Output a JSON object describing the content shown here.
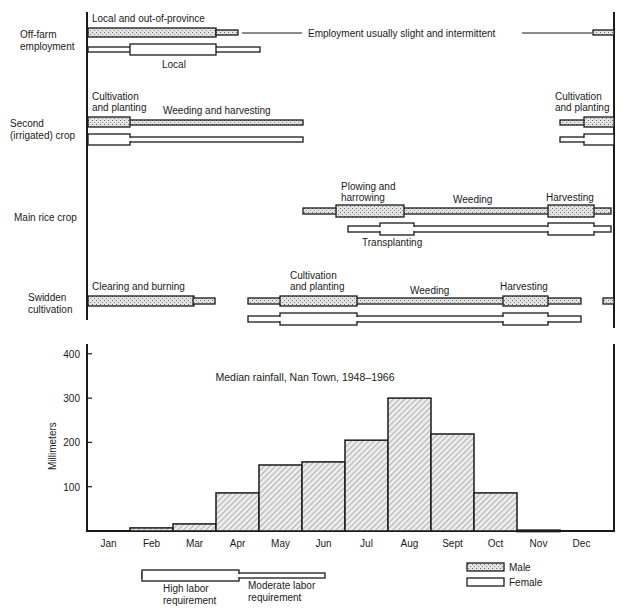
{
  "colors": {
    "ink": "#1a1a1a",
    "male_fill": "#d6d6d6",
    "female_fill": "#ffffff",
    "bar_fill": "#e2e2e2",
    "hatch": "#8a8a8a"
  },
  "activities": {
    "offfarm": {
      "row_label": [
        "Off-farm",
        "employment"
      ],
      "labels": {
        "male_top": "Local and out-of-province",
        "female_bottom": "Local",
        "note": "Employment usually slight and intermittent"
      }
    },
    "second": {
      "row_label": [
        "Second",
        "(irrigated) crop"
      ],
      "labels": {
        "cult_a": "Cultivation",
        "cult_b": "and planting",
        "weed": "Weeding and harvesting",
        "cult2_a": "Cultivation",
        "cult2_b": "and planting"
      }
    },
    "mainrice": {
      "row_label": [
        "Main rice crop"
      ],
      "labels": {
        "plow_a": "Plowing and",
        "plow_b": "harrowing",
        "weed": "Weeding",
        "harvest": "Harvesting",
        "transplant": "Transplanting"
      }
    },
    "swidden": {
      "row_label": [
        "Swidden",
        "cultivation"
      ],
      "labels": {
        "clear": "Clearing and burning",
        "cult_a": "Cultivation",
        "cult_b": "and planting",
        "weed": "Weeding",
        "harvest": "Harvesting"
      }
    }
  },
  "legend": {
    "high": [
      "High labor",
      "requirement"
    ],
    "moderate": [
      "Moderate labor",
      "requirement"
    ],
    "male": "Male",
    "female": "Female"
  },
  "chart_data": [
    {
      "type": "bar",
      "title": "Median rainfall, Nan Town, 1948–1966",
      "categories": [
        "Jan",
        "Feb",
        "Mar",
        "Apr",
        "May",
        "Jun",
        "Jul",
        "Aug",
        "Sept",
        "Oct",
        "Nov",
        "Dec"
      ],
      "values": [
        0,
        7,
        16,
        86,
        149,
        156,
        205,
        300,
        219,
        86,
        2,
        0
      ],
      "xlabel": "",
      "ylabel": "Millimeters",
      "yticks": [
        100,
        200,
        300,
        400
      ],
      "ylim": [
        0,
        420
      ],
      "grid": false,
      "bar_style": "hatched, no gaps"
    },
    {
      "type": "gantt",
      "title": "Seasonal labor calendar by activity and sex",
      "x_axis": "months Jan–Dec (shared with rainfall chart)",
      "legend": [
        "Male (stippled)",
        "Female (open)",
        "High labor requirement (wide bar)",
        "Moderate labor requirement (narrow bar)"
      ],
      "rows": [
        {
          "activity": "Off-farm employment",
          "sex": "Male",
          "segments": [
            {
              "from": "Jan",
              "to": "mid-Apr",
              "level": "high",
              "label": "Local and out-of-province"
            },
            {
              "from": "mid-Apr",
              "to": "early-May",
              "level": "moderate"
            },
            {
              "from": "early-May",
              "to": "late-Dec",
              "level": "slight",
              "label": "Employment usually slight and intermittent"
            },
            {
              "from": "late-Dec",
              "to": "Dec",
              "level": "moderate"
            }
          ]
        },
        {
          "activity": "Off-farm employment",
          "sex": "Female",
          "segments": [
            {
              "from": "Jan",
              "to": "early-Feb",
              "level": "moderate"
            },
            {
              "from": "early-Feb",
              "to": "mid-Apr",
              "level": "high",
              "label": "Local"
            },
            {
              "from": "mid-Apr",
              "to": "early-May",
              "level": "moderate"
            }
          ]
        },
        {
          "activity": "Second (irrigated) crop",
          "sex": "Male",
          "segments": [
            {
              "from": "Jan",
              "to": "Feb",
              "level": "high",
              "label": "Cultivation and planting"
            },
            {
              "from": "Feb",
              "to": "Jun",
              "level": "moderate",
              "label": "Weeding and harvesting"
            },
            {
              "from": "early-Dec",
              "to": "mid-Dec",
              "level": "moderate"
            },
            {
              "from": "mid-Dec",
              "to": "Dec",
              "level": "high",
              "label": "Cultivation and planting"
            }
          ]
        },
        {
          "activity": "Second (irrigated) crop",
          "sex": "Female",
          "segments": [
            {
              "from": "Jan",
              "to": "Feb",
              "level": "high"
            },
            {
              "from": "Feb",
              "to": "Jun",
              "level": "moderate"
            },
            {
              "from": "early-Dec",
              "to": "mid-Dec",
              "level": "moderate"
            },
            {
              "from": "mid-Dec",
              "to": "Dec",
              "level": "high"
            }
          ]
        },
        {
          "activity": "Main rice crop",
          "sex": "Male",
          "segments": [
            {
              "from": "Jun",
              "to": "late-Jun",
              "level": "moderate"
            },
            {
              "from": "late-Jun",
              "to": "late-Jul",
              "level": "high",
              "label": "Plowing and harrowing"
            },
            {
              "from": "late-Jul",
              "to": "mid-Nov",
              "level": "moderate",
              "label": "Weeding"
            },
            {
              "from": "mid-Nov",
              "to": "early-Dec",
              "level": "high",
              "label": "Harvesting"
            },
            {
              "from": "early-Dec",
              "to": "Dec",
              "level": "moderate"
            }
          ]
        },
        {
          "activity": "Main rice crop",
          "sex": "Female",
          "segments": [
            {
              "from": "early-Jul",
              "to": "mid-Jul",
              "level": "moderate"
            },
            {
              "from": "mid-Jul",
              "to": "late-Jul",
              "level": "high",
              "label": "Transplanting"
            },
            {
              "from": "late-Jul",
              "to": "mid-Nov",
              "level": "moderate"
            },
            {
              "from": "mid-Nov",
              "to": "early-Dec",
              "level": "high"
            },
            {
              "from": "early-Dec",
              "to": "Dec",
              "level": "moderate"
            }
          ]
        },
        {
          "activity": "Swidden cultivation",
          "sex": "Male",
          "segments": [
            {
              "from": "Jan",
              "to": "mid-Mar",
              "level": "high",
              "label": "Clearing and burning"
            },
            {
              "from": "mid-Mar",
              "to": "late-Mar",
              "level": "moderate"
            },
            {
              "from": "Apr",
              "to": "late-Apr",
              "level": "moderate"
            },
            {
              "from": "late-Apr",
              "to": "late-May",
              "level": "high",
              "label": "Cultivation and planting"
            },
            {
              "from": "late-May",
              "to": "late-Sept",
              "level": "moderate",
              "label": "Weeding"
            },
            {
              "from": "late-Sept",
              "to": "early-Oct",
              "level": "high",
              "label": "Harvesting"
            },
            {
              "from": "early-Oct",
              "to": "Oct",
              "level": "moderate"
            },
            {
              "from": "late-Dec",
              "to": "Dec",
              "level": "moderate"
            }
          ]
        },
        {
          "activity": "Swidden cultivation",
          "sex": "Female",
          "segments": [
            {
              "from": "Apr",
              "to": "late-Apr",
              "level": "moderate"
            },
            {
              "from": "late-Apr",
              "to": "late-May",
              "level": "high"
            },
            {
              "from": "late-May",
              "to": "late-Sept",
              "level": "moderate"
            },
            {
              "from": "late-Sept",
              "to": "early-Oct",
              "level": "high"
            },
            {
              "from": "early-Oct",
              "to": "Oct",
              "level": "moderate"
            }
          ]
        }
      ]
    }
  ]
}
